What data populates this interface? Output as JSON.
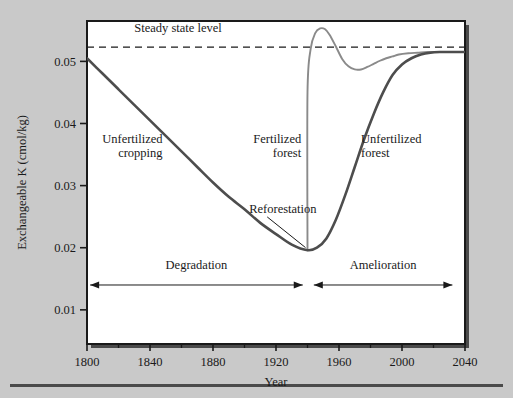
{
  "figure": {
    "background_color": "#c9c9c9",
    "plot_background_color": "#ffffff",
    "frame_color": "#1a1a1a",
    "rule_color": "#4a4a4a"
  },
  "chart_data": {
    "type": "line",
    "title": "",
    "xlabel": "Year",
    "ylabel": "Exchangeable K (cmol/kg)",
    "xlim": [
      1800,
      2040
    ],
    "ylim": [
      0.0045,
      0.0565
    ],
    "xticks": [
      1800,
      1840,
      1880,
      1920,
      1960,
      2000,
      2040
    ],
    "xtick_labels": [
      "1800",
      "1840",
      "1880",
      "1920",
      "1960",
      "2000",
      "2040"
    ],
    "minor_xticks": [
      1820,
      1860,
      1900,
      1940,
      1980,
      2020
    ],
    "yticks": [
      0.01,
      0.02,
      0.03,
      0.04,
      0.05
    ],
    "ytick_labels": [
      "0.01",
      "0.02",
      "0.03",
      "0.04",
      "0.05"
    ],
    "grid": false,
    "legend": "none",
    "steady_state_level": 0.0523,
    "reforestation_year": 1940,
    "series": [
      {
        "name": "Unfertilized cropping / Unfertilized forest",
        "color": "#4d4d4d",
        "width": 2.6,
        "x": [
          1800,
          1810,
          1820,
          1830,
          1840,
          1850,
          1860,
          1870,
          1880,
          1890,
          1900,
          1910,
          1920,
          1930,
          1940,
          1946,
          1952,
          1958,
          1964,
          1970,
          1976,
          1982,
          1988,
          1994,
          2000,
          2006,
          2012,
          2018,
          2024,
          2030,
          2036,
          2040
        ],
        "y": [
          0.0505,
          0.048,
          0.0455,
          0.043,
          0.0405,
          0.038,
          0.0355,
          0.033,
          0.0305,
          0.0282,
          0.0262,
          0.024,
          0.0222,
          0.0205,
          0.0196,
          0.02,
          0.0215,
          0.0245,
          0.0285,
          0.033,
          0.0375,
          0.0415,
          0.045,
          0.0478,
          0.0495,
          0.0505,
          0.0511,
          0.0514,
          0.0515,
          0.0515,
          0.0515,
          0.0515
        ]
      },
      {
        "name": "Fertilized forest",
        "color": "#8a8a8a",
        "width": 1.9,
        "x": [
          1940,
          1940,
          1942,
          1945,
          1948,
          1951,
          1954,
          1958,
          1962,
          1966,
          1970,
          1974,
          1978,
          1982,
          1986,
          1990,
          1994,
          1998,
          2004,
          2010,
          2016,
          2022,
          2030,
          2040
        ],
        "y": [
          0.0196,
          0.045,
          0.052,
          0.0546,
          0.0553,
          0.0552,
          0.0543,
          0.0524,
          0.0504,
          0.0492,
          0.0487,
          0.0487,
          0.0491,
          0.0496,
          0.0501,
          0.0505,
          0.0508,
          0.0511,
          0.0513,
          0.0514,
          0.0515,
          0.0515,
          0.0515,
          0.0515
        ]
      }
    ],
    "annotations": [
      {
        "id": "steady-state",
        "text": "Steady state level",
        "x": 1830,
        "y": 0.0547
      },
      {
        "id": "unfertilized-cropping",
        "text_line1": "Unfertilized",
        "text_line2": "cropping",
        "x": 1848,
        "y": 0.0368
      },
      {
        "id": "fertilized-forest",
        "text_line1": "Fertilized",
        "text_line2": "forest",
        "x": 1936,
        "y": 0.0368
      },
      {
        "id": "unfertilized-forest",
        "text_line1": "Unfertilized",
        "text_line2": "forest",
        "x": 1974,
        "y": 0.0368
      },
      {
        "id": "reforestation",
        "text": "Reforestation",
        "x": 1903,
        "y": 0.0256
      }
    ],
    "phase_arrows": [
      {
        "id": "degradation",
        "label": "Degradation",
        "x_start": 1802,
        "x_end": 1937,
        "y": 0.014,
        "label_y": 0.0165
      },
      {
        "id": "amelioration",
        "label": "Amelioration",
        "x_start": 1944,
        "x_end": 2032,
        "y": 0.014,
        "label_y": 0.0165
      }
    ]
  }
}
